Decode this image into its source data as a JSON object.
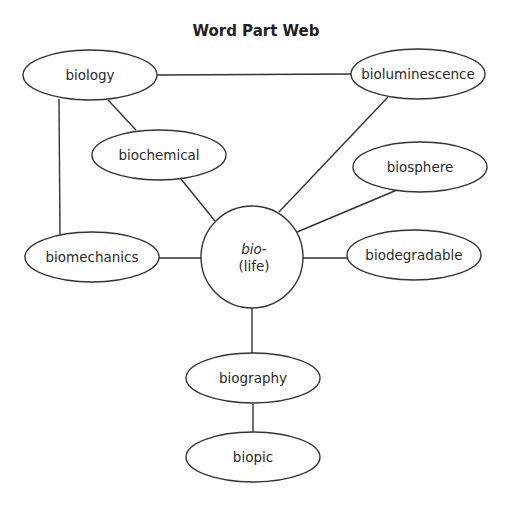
{
  "title": "Word Part Web",
  "center": {
    "root": "bio-",
    "meaning": "(life)"
  },
  "nodes": {
    "biology": "biology",
    "bioluminescence": "bioluminescence",
    "biochemical": "biochemical",
    "biosphere": "biosphere",
    "biomechanics": "biomechanics",
    "biodegradable": "biodegradable",
    "biography": "biography",
    "biopic": "biopic"
  },
  "edges": [
    [
      "biology",
      "bioluminescence"
    ],
    [
      "biology",
      "biochemical"
    ],
    [
      "biology",
      "biomechanics"
    ],
    [
      "biochemical",
      "center"
    ],
    [
      "bioluminescence",
      "center"
    ],
    [
      "biosphere",
      "center"
    ],
    [
      "biomechanics",
      "center"
    ],
    [
      "biodegradable",
      "center"
    ],
    [
      "center",
      "biography"
    ],
    [
      "biography",
      "biopic"
    ]
  ]
}
